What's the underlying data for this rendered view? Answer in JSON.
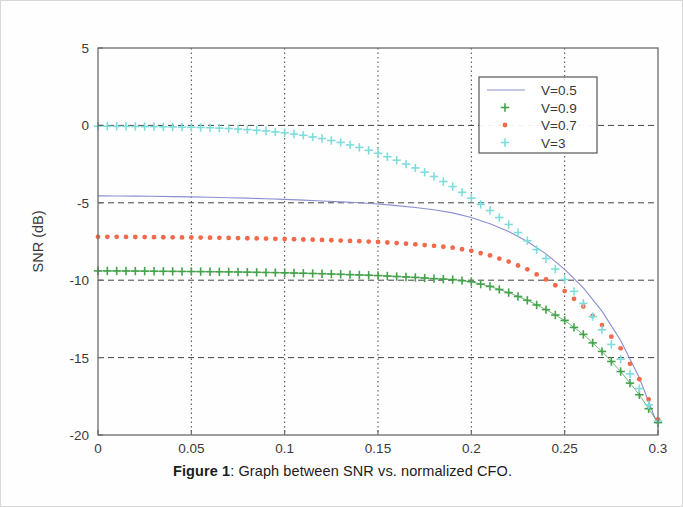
{
  "caption": {
    "label": "Figure 1",
    "separator": ":",
    "text": "Graph between SNR vs. normalized CFO."
  },
  "chart_data": {
    "type": "line",
    "title": "",
    "xlabel": "Normalized CFO",
    "ylabel": "SNR (dB)",
    "xlim": [
      0,
      0.3
    ],
    "ylim": [
      -20,
      5
    ],
    "xticks": [
      0,
      0.05,
      0.1,
      0.15,
      0.2,
      0.25,
      0.3
    ],
    "xticklabels": [
      "0",
      "0.05",
      "0.1",
      "0.15",
      "0.2",
      "0.25",
      "0.3"
    ],
    "yticks": [
      5,
      0,
      -5,
      -10,
      -15,
      -20
    ],
    "yticklabels": [
      "5",
      "0",
      "-5",
      "-10",
      "-15",
      "-20"
    ],
    "grid": true,
    "grid_style": "dashed",
    "legend_position": "upper right",
    "x": [
      0,
      0.01,
      0.02,
      0.03,
      0.04,
      0.05,
      0.06,
      0.07,
      0.08,
      0.09,
      0.1,
      0.11,
      0.12,
      0.13,
      0.14,
      0.15,
      0.16,
      0.17,
      0.18,
      0.19,
      0.2,
      0.21,
      0.22,
      0.23,
      0.24,
      0.25,
      0.26,
      0.27,
      0.28,
      0.29,
      0.3
    ],
    "series": [
      {
        "name": "V=0.5",
        "color": "#8a8fd0",
        "marker": "none",
        "linestyle": "solid",
        "values": [
          -4.55,
          -4.56,
          -4.57,
          -4.58,
          -4.6,
          -4.62,
          -4.64,
          -4.67,
          -4.7,
          -4.74,
          -4.78,
          -4.83,
          -4.88,
          -4.94,
          -5.0,
          -5.08,
          -5.18,
          -5.3,
          -5.45,
          -5.65,
          -5.95,
          -6.35,
          -6.85,
          -7.5,
          -8.3,
          -9.3,
          -10.5,
          -12.0,
          -13.9,
          -16.3,
          -19.4
        ]
      },
      {
        "name": "V=0.9",
        "color": "#44a24a",
        "marker": "plus",
        "linestyle": "solid",
        "values": [
          -9.4,
          -9.4,
          -9.41,
          -9.42,
          -9.43,
          -9.44,
          -9.45,
          -9.46,
          -9.48,
          -9.5,
          -9.52,
          -9.55,
          -9.58,
          -9.62,
          -9.66,
          -9.7,
          -9.76,
          -9.82,
          -9.9,
          -9.96,
          -10.1,
          -10.4,
          -10.8,
          -11.3,
          -11.9,
          -12.6,
          -13.5,
          -14.6,
          -15.9,
          -17.4,
          -19.2
        ]
      },
      {
        "name": "V=0.7",
        "color": "#f26a4b",
        "marker": "dot",
        "linestyle": "none",
        "values": [
          -7.2,
          -7.2,
          -7.21,
          -7.22,
          -7.23,
          -7.24,
          -7.25,
          -7.27,
          -7.29,
          -7.31,
          -7.34,
          -7.37,
          -7.4,
          -7.44,
          -7.48,
          -7.53,
          -7.6,
          -7.68,
          -7.78,
          -7.9,
          -8.1,
          -8.4,
          -8.8,
          -9.3,
          -9.95,
          -10.7,
          -11.7,
          -12.9,
          -14.4,
          -16.4,
          -19.0
        ]
      },
      {
        "name": "V=3",
        "color": "#7fdcdc",
        "marker": "plus",
        "linestyle": "none",
        "values": [
          -0.05,
          -0.06,
          -0.07,
          -0.08,
          -0.1,
          -0.12,
          -0.15,
          -0.2,
          -0.27,
          -0.36,
          -0.48,
          -0.64,
          -0.85,
          -1.1,
          -1.42,
          -1.8,
          -2.25,
          -2.75,
          -3.3,
          -3.95,
          -4.7,
          -5.5,
          -6.4,
          -7.45,
          -8.6,
          -9.95,
          -11.5,
          -13.2,
          -15.1,
          -17.0,
          -19.1
        ]
      }
    ]
  }
}
